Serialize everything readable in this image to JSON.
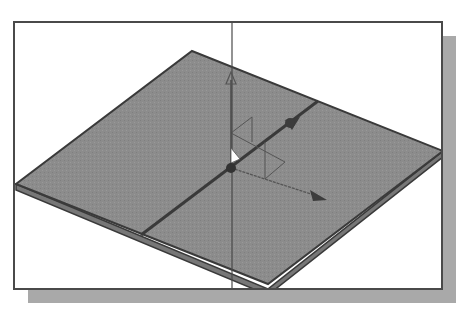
{
  "figure": {
    "kind": "cad-3d-viewport",
    "colors": {
      "background": "#ffffff",
      "frame_border": "#4a4a4a",
      "drop_shadow": "#a9a9a9",
      "plate_face": "#8c8c8c",
      "plate_edge": "#3a3a3a",
      "plate_side": "#777777",
      "axis_line": "#4a4a4a",
      "triad_line": "#555555",
      "arrow_head": "#3c3c3c",
      "origin_marker": "#ffffff"
    },
    "frame": {
      "left": 13,
      "top": 21,
      "right": 441,
      "bottom": 288
    },
    "shadow": {
      "offset_x": 15,
      "offset_y": 15
    },
    "plate": {
      "top": [
        190,
        49
      ],
      "right": [
        441,
        149
      ],
      "bottom": [
        266,
        287
      ],
      "left": [
        14,
        182
      ],
      "thickness": 5
    },
    "vertical_axis_x": 230,
    "triad": {
      "origin": [
        229,
        166
      ],
      "y_axis_end": [
        229,
        72
      ],
      "x_axis_end": [
        322,
        198
      ],
      "z_axis_end": [
        296,
        112
      ],
      "labels": []
    }
  }
}
